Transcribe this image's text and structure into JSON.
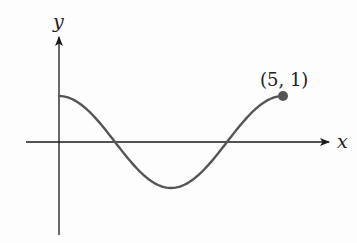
{
  "chart_data": {
    "type": "line",
    "title": "",
    "xlabel": "x",
    "ylabel": "y",
    "function_shape": "cosine, one full period from x=0 to x=5",
    "x": [
      0,
      0.625,
      1.25,
      1.875,
      2.5,
      3.125,
      3.75,
      4.375,
      5
    ],
    "values": [
      1,
      0.707,
      0,
      -0.707,
      -1,
      -0.707,
      0,
      0.707,
      1
    ],
    "xlim": [
      -0.75,
      6
    ],
    "ylim": [
      -2.1,
      2.6
    ],
    "grid": false,
    "legend": null,
    "annotations": [
      {
        "text": "(5, 1)",
        "x": 5,
        "y": 1,
        "marker": "filled-circle"
      }
    ]
  },
  "axes": {
    "x_label": "x",
    "y_label": "y"
  },
  "annotation": {
    "endpoint_label": "(5, 1)"
  },
  "colors": {
    "axis": "#1a1a1a",
    "curve": "#555555",
    "point": "#555555"
  }
}
